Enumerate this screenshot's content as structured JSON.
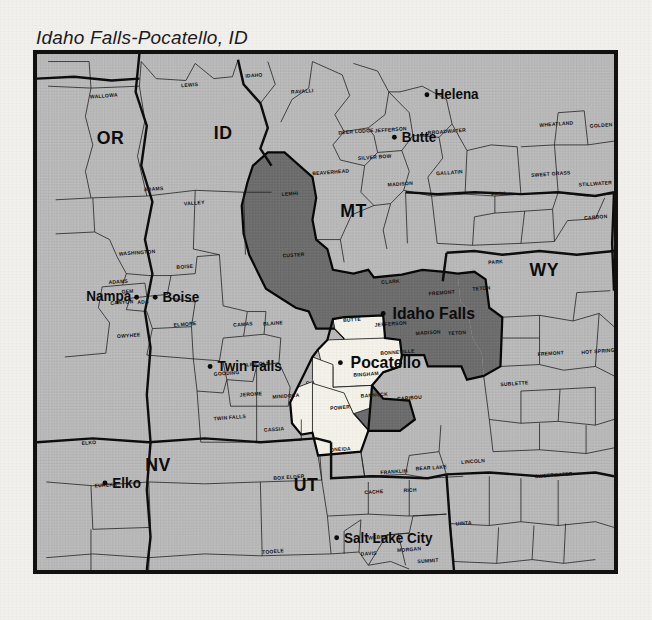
{
  "title": "Idaho Falls-Pocatello, ID",
  "map": {
    "name": "dma-coverage-map",
    "colors": {
      "background": "#b9b9b9",
      "core_dma": "#f4f2ea",
      "secondary_dma": "#6d6d6d",
      "border": "#111111",
      "page": "#f2f0ec"
    },
    "states": [
      {
        "abbr": "OR",
        "x": 79,
        "y": 95
      },
      {
        "abbr": "ID",
        "x": 200,
        "y": 90
      },
      {
        "abbr": "MT",
        "x": 340,
        "y": 172
      },
      {
        "abbr": "WY",
        "x": 545,
        "y": 235
      },
      {
        "abbr": "NV",
        "x": 130,
        "y": 440
      },
      {
        "abbr": "UT",
        "x": 289,
        "y": 462
      }
    ],
    "cities": [
      {
        "name": "Helena",
        "x": 427,
        "y": 48,
        "dot_x": 419,
        "dot_y": 43,
        "size": "normal"
      },
      {
        "name": "Butte",
        "x": 392,
        "y": 93,
        "dot_x": 384,
        "dot_y": 88,
        "size": "normal"
      },
      {
        "name": "Boise",
        "x": 135,
        "y": 262,
        "dot_x": 127,
        "dot_y": 257,
        "size": "normal"
      },
      {
        "name": "Nampa",
        "x": 53,
        "y": 261,
        "dot_x": 107,
        "dot_y": 257,
        "size": "normal"
      },
      {
        "name": "Idaho Falls",
        "x": 382,
        "y": 280,
        "dot_x": 372,
        "dot_y": 274,
        "size": "big"
      },
      {
        "name": "Pocatello",
        "x": 337,
        "y": 332,
        "dot_x": 326,
        "dot_y": 326,
        "size": "big"
      },
      {
        "name": "Twin Falls",
        "x": 194,
        "y": 335,
        "dot_x": 186,
        "dot_y": 330,
        "size": "normal"
      },
      {
        "name": "Elko",
        "x": 81,
        "y": 458,
        "dot_x": 73,
        "dot_y": 453,
        "size": "normal"
      },
      {
        "name": "Salt Lake City",
        "x": 330,
        "y": 516,
        "dot_x": 322,
        "dot_y": 511,
        "size": "normal"
      }
    ],
    "counties": [
      {
        "name": "WALLOWA",
        "x": 57,
        "y": 47,
        "region": "background"
      },
      {
        "name": "LEWIS",
        "x": 155,
        "y": 35,
        "region": "background"
      },
      {
        "name": "IDAHO",
        "x": 224,
        "y": 25,
        "region": "background"
      },
      {
        "name": "RAVALLI",
        "x": 273,
        "y": 42,
        "region": "background"
      },
      {
        "name": "DEER LODGE",
        "x": 324,
        "y": 85,
        "region": "background"
      },
      {
        "name": "JEFFERSON",
        "x": 363,
        "y": 83,
        "region": "background"
      },
      {
        "name": "BROADWATER",
        "x": 420,
        "y": 85,
        "region": "background"
      },
      {
        "name": "WHEATLAND",
        "x": 540,
        "y": 77,
        "region": "background"
      },
      {
        "name": "GOLDEN VALLEY",
        "x": 594,
        "y": 78,
        "region": "background"
      },
      {
        "name": "SILVER BOW",
        "x": 345,
        "y": 112,
        "region": "background"
      },
      {
        "name": "BEAVERHEAD",
        "x": 296,
        "y": 128,
        "region": "background"
      },
      {
        "name": "MADISON",
        "x": 377,
        "y": 140,
        "region": "background"
      },
      {
        "name": "GALLATIN",
        "x": 429,
        "y": 128,
        "region": "background"
      },
      {
        "name": "PARK",
        "x": 488,
        "y": 150,
        "region": "background"
      },
      {
        "name": "SWEET GRASS",
        "x": 531,
        "y": 130,
        "region": "background"
      },
      {
        "name": "STILLWATER",
        "x": 582,
        "y": 140,
        "region": "background"
      },
      {
        "name": "CARBON",
        "x": 588,
        "y": 175,
        "region": "background"
      },
      {
        "name": "ADAMS",
        "x": 115,
        "y": 145,
        "region": "background"
      },
      {
        "name": "VALLEY",
        "x": 158,
        "y": 160,
        "region": "background"
      },
      {
        "name": "LEMHI",
        "x": 263,
        "y": 150,
        "region": "secondary"
      },
      {
        "name": "CUSTER",
        "x": 264,
        "y": 215,
        "region": "secondary"
      },
      {
        "name": "CLARK",
        "x": 370,
        "y": 243,
        "region": "secondary"
      },
      {
        "name": "FREMONT",
        "x": 421,
        "y": 255,
        "region": "secondary"
      },
      {
        "name": "TETON",
        "x": 468,
        "y": 250,
        "region": "secondary"
      },
      {
        "name": "PARK",
        "x": 485,
        "y": 222,
        "region": "background"
      },
      {
        "name": "BUTTE",
        "x": 329,
        "y": 283,
        "region": "secondary"
      },
      {
        "name": "JEFFERSON",
        "x": 363,
        "y": 288,
        "region": "core"
      },
      {
        "name": "MADISON",
        "x": 407,
        "y": 297,
        "region": "secondary"
      },
      {
        "name": "TETON",
        "x": 442,
        "y": 297,
        "region": "secondary"
      },
      {
        "name": "WASHINGTON",
        "x": 88,
        "y": 213,
        "region": "background"
      },
      {
        "name": "ADAMS",
        "x": 77,
        "y": 243,
        "region": "background"
      },
      {
        "name": "GEM",
        "x": 91,
        "y": 253,
        "region": "background"
      },
      {
        "name": "CANYON",
        "x": 79,
        "y": 265,
        "region": "background"
      },
      {
        "name": "ADA",
        "x": 108,
        "y": 264,
        "region": "background"
      },
      {
        "name": "BOISE",
        "x": 150,
        "y": 227,
        "region": "background"
      },
      {
        "name": "OWYHEE",
        "x": 86,
        "y": 300,
        "region": "background"
      },
      {
        "name": "ELMORE",
        "x": 147,
        "y": 288,
        "region": "background"
      },
      {
        "name": "CAMAS",
        "x": 211,
        "y": 288,
        "region": "background"
      },
      {
        "name": "BLAINE",
        "x": 243,
        "y": 287,
        "region": "background"
      },
      {
        "name": "GOODING",
        "x": 190,
        "y": 340,
        "region": "background"
      },
      {
        "name": "LINCOLN",
        "x": 225,
        "y": 330,
        "region": "background"
      },
      {
        "name": "JEROME",
        "x": 218,
        "y": 362,
        "region": "background"
      },
      {
        "name": "MINIDOKA",
        "x": 253,
        "y": 364,
        "region": "background"
      },
      {
        "name": "TWIN FALLS",
        "x": 190,
        "y": 387,
        "region": "background"
      },
      {
        "name": "CASSIA",
        "x": 244,
        "y": 399,
        "region": "background"
      },
      {
        "name": "BONNEVILLE",
        "x": 369,
        "y": 318,
        "region": "core"
      },
      {
        "name": "BINGHAM",
        "x": 340,
        "y": 341,
        "region": "core"
      },
      {
        "name": "BANNOCK",
        "x": 348,
        "y": 363,
        "region": "core"
      },
      {
        "name": "CARIBOU",
        "x": 387,
        "y": 366,
        "region": "secondary"
      },
      {
        "name": "POWER",
        "x": 315,
        "y": 376,
        "region": "core"
      },
      {
        "name": "ONEIDA",
        "x": 315,
        "y": 420,
        "region": "core"
      },
      {
        "name": "SUBLETTE",
        "x": 498,
        "y": 351,
        "region": "background"
      },
      {
        "name": "FREMONT",
        "x": 538,
        "y": 319,
        "region": "background"
      },
      {
        "name": "HOT SPRINGS",
        "x": 585,
        "y": 317,
        "region": "background"
      },
      {
        "name": "ELKO",
        "x": 48,
        "y": 413,
        "region": "background"
      },
      {
        "name": "EUREKA",
        "x": 62,
        "y": 458,
        "region": "background"
      },
      {
        "name": "FRANKLIN",
        "x": 369,
        "y": 444,
        "region": "background"
      },
      {
        "name": "BEAR LAKE",
        "x": 407,
        "y": 440,
        "region": "background"
      },
      {
        "name": "LINCOLN",
        "x": 456,
        "y": 433,
        "region": "background"
      },
      {
        "name": "SWEETWATER",
        "x": 535,
        "y": 448,
        "region": "background"
      },
      {
        "name": "BOX ELDER",
        "x": 254,
        "y": 450,
        "region": "background"
      },
      {
        "name": "CACHE",
        "x": 352,
        "y": 465,
        "region": "background"
      },
      {
        "name": "RICH",
        "x": 394,
        "y": 463,
        "region": "background"
      },
      {
        "name": "UINTA",
        "x": 450,
        "y": 498,
        "region": "background"
      },
      {
        "name": "TOOELE",
        "x": 242,
        "y": 528,
        "region": "background"
      },
      {
        "name": "WEBER",
        "x": 356,
        "y": 513,
        "region": "background"
      },
      {
        "name": "DAVIS",
        "x": 348,
        "y": 530,
        "region": "background"
      },
      {
        "name": "MORGAN",
        "x": 387,
        "y": 526,
        "region": "background"
      },
      {
        "name": "SUMMIT",
        "x": 409,
        "y": 538,
        "region": "background"
      },
      {
        "name": "SALT LAKE",
        "x": 359,
        "y": 557,
        "region": "background"
      },
      {
        "name": "DUCHESNE",
        "x": 457,
        "y": 566,
        "region": "background"
      },
      {
        "name": "DAGGETT",
        "x": 525,
        "y": 557,
        "region": "background"
      },
      {
        "name": "UINTAH",
        "x": 532,
        "y": 572,
        "region": "background"
      },
      {
        "name": "MOFFAT",
        "x": 593,
        "y": 558,
        "region": "background"
      }
    ]
  }
}
